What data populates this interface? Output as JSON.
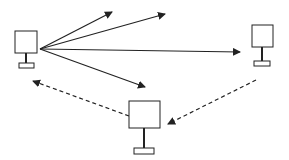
{
  "diagram": {
    "width": 289,
    "height": 160,
    "colors": {
      "background": "#ffffff",
      "stroke": "#222222",
      "fill": "#ffffff"
    },
    "nodes": [
      {
        "id": "left-monitor",
        "icon": "monitor-icon",
        "screen": {
          "x": 15,
          "y": 31,
          "w": 22,
          "h": 22
        },
        "stem": {
          "x": 26,
          "y1": 53,
          "y2": 63
        },
        "base": {
          "x": 19,
          "y": 63,
          "w": 15,
          "h": 5
        }
      },
      {
        "id": "right-monitor",
        "icon": "monitor-icon",
        "screen": {
          "x": 252,
          "y": 25,
          "w": 21,
          "h": 22
        },
        "stem": {
          "x": 262,
          "y1": 47,
          "y2": 61
        },
        "base": {
          "x": 254,
          "y": 61,
          "w": 16,
          "h": 5
        }
      },
      {
        "id": "bottom-monitor",
        "icon": "monitor-icon",
        "screen": {
          "x": 129,
          "y": 101,
          "w": 31,
          "h": 27
        },
        "stem": {
          "x": 144,
          "y1": 128,
          "y2": 148
        },
        "base": {
          "x": 134,
          "y": 148,
          "w": 20,
          "h": 6
        }
      }
    ],
    "edges": [
      {
        "id": "solid-arrow-1",
        "style": "solid",
        "from": [
          40,
          49
        ],
        "to": [
          112,
          12
        ]
      },
      {
        "id": "solid-arrow-2",
        "style": "solid",
        "from": [
          40,
          49
        ],
        "to": [
          165,
          14
        ]
      },
      {
        "id": "solid-arrow-3",
        "style": "solid",
        "from": [
          40,
          49
        ],
        "to": [
          240,
          52
        ]
      },
      {
        "id": "solid-arrow-4",
        "style": "solid",
        "from": [
          40,
          49
        ],
        "to": [
          145,
          87
        ]
      },
      {
        "id": "dashed-arrow-bottom-to-left",
        "style": "dashed",
        "from": [
          129,
          116
        ],
        "to": [
          33,
          81
        ]
      },
      {
        "id": "dashed-arrow-right-to-bottom",
        "style": "dashed",
        "from": [
          256,
          80
        ],
        "to": [
          168,
          124
        ]
      }
    ]
  }
}
